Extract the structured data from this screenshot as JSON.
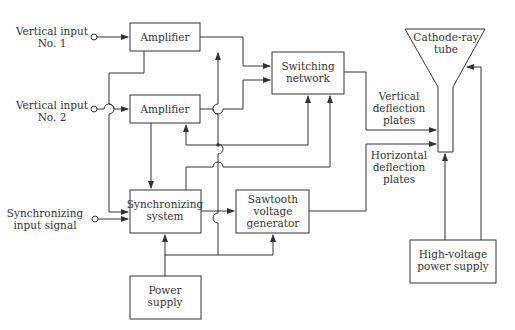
{
  "diagram": {
    "type": "block-diagram",
    "inputs": [
      {
        "id": "vin1",
        "label": [
          "Vertical input",
          "No. 1"
        ]
      },
      {
        "id": "vin2",
        "label": [
          "Vertical input",
          "No. 2"
        ]
      },
      {
        "id": "syncin",
        "label": [
          "Synchronizing",
          "input signal"
        ]
      }
    ],
    "blocks": [
      {
        "id": "amp1",
        "label": [
          "Amplifier"
        ]
      },
      {
        "id": "amp2",
        "label": [
          "Amplifier"
        ]
      },
      {
        "id": "switch",
        "label": [
          "Switching",
          "network"
        ]
      },
      {
        "id": "sync",
        "label": [
          "Synchronizing",
          "system"
        ]
      },
      {
        "id": "saw",
        "label": [
          "Sawtooth",
          "voltage",
          "generator"
        ]
      },
      {
        "id": "power",
        "label": [
          "Power",
          "supply"
        ]
      },
      {
        "id": "hv",
        "label": [
          "High-voltage",
          "power supply"
        ]
      },
      {
        "id": "crt",
        "label": [
          "Cathode-ray",
          "tube"
        ]
      }
    ],
    "annotations": [
      {
        "id": "vplates",
        "label": [
          "Vertical",
          "deflection",
          "plates"
        ]
      },
      {
        "id": "hplates",
        "label": [
          "Horizontal",
          "deflection",
          "plates"
        ]
      }
    ]
  }
}
